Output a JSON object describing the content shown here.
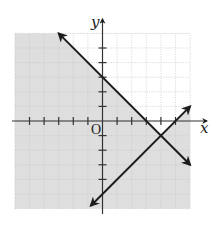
{
  "chart_data": {
    "type": "line",
    "title": "",
    "xlabel": "x",
    "ylabel": "y",
    "origin_label": "O",
    "xlim": [
      -6,
      6
    ],
    "ylim": [
      -6,
      6
    ],
    "grid": true,
    "tick_step": 1,
    "x_ticks": [
      -5,
      -4,
      -3,
      -2,
      -1,
      1,
      2,
      3,
      4,
      5
    ],
    "y_ticks": [
      -4,
      -3,
      -2,
      -1,
      1,
      2,
      3,
      4,
      5
    ],
    "series": [
      {
        "name": "line-1",
        "equation": "y = -x + 3",
        "slope": -1,
        "intercept": 3,
        "from": [
          -3,
          6
        ],
        "to": [
          6,
          -3
        ],
        "arrows": "both"
      },
      {
        "name": "line-2",
        "equation": "y = x - 5",
        "slope": 1,
        "intercept": -5,
        "from": [
          -0.8,
          -5.8
        ],
        "to": [
          6,
          1
        ],
        "arrows": "both"
      }
    ],
    "intersection": [
      4,
      -1
    ],
    "shading": {
      "description": "Shaded region is y <= -x + 3 or y <= x - 5; unshaded region lies above both lines",
      "shaded_color": "#dedede",
      "unshaded_color": "#ffffff"
    }
  }
}
